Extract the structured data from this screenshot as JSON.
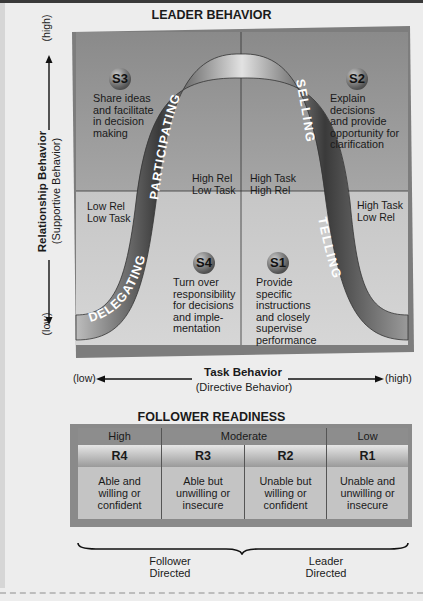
{
  "diagram": {
    "title": "LEADER BEHAVIOR",
    "y_axis": {
      "label": "Relationship Behavior",
      "sublabel": "(Supportive Behavior)",
      "high": "(high)",
      "low": "(low)"
    },
    "x_axis": {
      "label": "Task Behavior",
      "sublabel": "(Directive Behavior)",
      "low": "(low)",
      "high": "(high)"
    },
    "curve_labels": [
      "DELEGATING",
      "PARTICIPATING",
      "SELLING",
      "TELLING"
    ],
    "quadrant_corner_labels": {
      "high_rel_low_task": [
        "High Rel",
        "Low Task"
      ],
      "high_task_high_rel": [
        "High Task",
        "High Rel"
      ],
      "low_rel_low_task": [
        "Low Rel",
        "Low Task"
      ],
      "high_task_low_rel": [
        "High Task",
        "Low Rel"
      ]
    },
    "styles": [
      {
        "id": "S3",
        "lines": [
          "Share ideas",
          "and facilitate",
          "in decision",
          "making"
        ]
      },
      {
        "id": "S2",
        "lines": [
          "Explain",
          "decisions",
          "and provide",
          "opportunity for",
          "clarification"
        ]
      },
      {
        "id": "S4",
        "lines": [
          "Turn over",
          "responsibility",
          "for decisions",
          "and imple-",
          "mentation"
        ]
      },
      {
        "id": "S1",
        "lines": [
          "Provide",
          "specific",
          "instructions",
          "and closely",
          "supervise",
          "performance"
        ]
      }
    ],
    "colors": {
      "top_panel": "#8f8f8f",
      "bottom_panel": "#c9c9c9",
      "curve_dark": "#2b2b2b",
      "curve_light": "#d8d8d8"
    }
  },
  "readiness": {
    "title": "FOLLOWER READINESS",
    "levels": [
      "High",
      "Moderate",
      "Low"
    ],
    "codes": [
      "R4",
      "R3",
      "R2",
      "R1"
    ],
    "descriptions": [
      [
        "Able and",
        "willing or",
        "confident"
      ],
      [
        "Able but",
        "unwilling or",
        "insecure"
      ],
      [
        "Unable but",
        "willing or",
        "confident"
      ],
      [
        "Unable and",
        "unwilling or",
        "insecure"
      ]
    ],
    "groups": [
      {
        "lines": [
          "Follower",
          "Directed"
        ]
      },
      {
        "lines": [
          "Leader",
          "Directed"
        ]
      }
    ]
  }
}
